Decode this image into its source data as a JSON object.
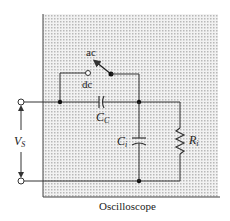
{
  "diagram": {
    "caption": "Oscilloscope",
    "switch": {
      "ac_label": "ac",
      "dc_label": "dc"
    },
    "components": {
      "coupling_capacitor": {
        "symbol": "C",
        "subscript": "C"
      },
      "input_capacitor": {
        "symbol": "C",
        "subscript": "i"
      },
      "input_resistor": {
        "symbol": "R",
        "subscript": "i"
      }
    },
    "source": {
      "symbol": "V",
      "subscript": "S"
    },
    "colors": {
      "background": "#ffffff",
      "shade": "#d9d9d9",
      "line": "#333333"
    }
  }
}
